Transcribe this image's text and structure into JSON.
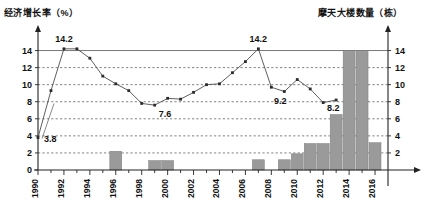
{
  "titles": {
    "left_axis": "经济增长率（%）",
    "right_axis": "摩天大楼数量（栋）"
  },
  "chart_data": {
    "type": "bar",
    "title": "",
    "subtitle": "",
    "xlabel": "",
    "ylabel": "经济增长率（%）",
    "y2label": "摩天大楼数量（栋）",
    "grid": true,
    "legend": "none",
    "ylim": [
      0,
      15
    ],
    "y2lim": [
      0,
      15
    ],
    "yticks": [
      0,
      2,
      4,
      6,
      8,
      10,
      12,
      14
    ],
    "y2ticks": [
      2,
      4,
      6,
      8,
      10,
      12,
      14
    ],
    "xlim": [
      1990,
      2017
    ],
    "xticks": [
      1990,
      1992,
      1994,
      1996,
      1998,
      2000,
      2002,
      2004,
      2006,
      2008,
      2010,
      2012,
      2014,
      2016
    ],
    "xtick_labels": [
      "1990",
      "1992",
      "1994",
      "1996",
      "1998",
      "2000",
      "2002",
      "2004",
      "2006",
      "2008",
      "2010",
      "2012",
      "2014",
      "2016"
    ],
    "x_minor_ticks_every": 1,
    "series": [
      {
        "name": "经济增长率",
        "type": "line",
        "axis": "left",
        "unit": "%",
        "x": [
          1990,
          1991,
          1992,
          1993,
          1994,
          1995,
          1996,
          1997,
          1998,
          1999,
          2000,
          2001,
          2002,
          2003,
          2004,
          2005,
          2006,
          2007,
          2008,
          2009,
          2010,
          2011,
          2012,
          2013
        ],
        "values": [
          3.8,
          9.3,
          14.2,
          14.2,
          13.1,
          11.0,
          10.1,
          9.3,
          7.8,
          7.6,
          8.4,
          8.3,
          9.1,
          10.0,
          10.1,
          11.4,
          12.7,
          14.2,
          9.7,
          9.2,
          10.6,
          9.5,
          7.9,
          8.2
        ]
      },
      {
        "name": "摩天大楼数量",
        "type": "bar",
        "axis": "right",
        "unit": "栋",
        "x": [
          1990,
          1991,
          1992,
          1993,
          1994,
          1995,
          1996,
          1997,
          1998,
          1999,
          2000,
          2001,
          2002,
          2003,
          2004,
          2005,
          2006,
          2007,
          2008,
          2009,
          2010,
          2011,
          2012,
          2013,
          2014,
          2015,
          2016
        ],
        "values": [
          0,
          0,
          0,
          0,
          0,
          0,
          2.2,
          0,
          0,
          1.1,
          1.1,
          0,
          0,
          0,
          0,
          0,
          0,
          1.2,
          0,
          1.2,
          1.9,
          3.1,
          3.1,
          6.5,
          13.9,
          13.9,
          3.2
        ]
      }
    ],
    "annotations": [
      {
        "text": "3.8",
        "x": 1990,
        "y": 3.8,
        "series": "经济增长率"
      },
      {
        "text": "14.2",
        "x": 1992,
        "y": 14.2,
        "series": "经济增长率"
      },
      {
        "text": "7.6",
        "x": 1999,
        "y": 7.6,
        "series": "经济增长率"
      },
      {
        "text": "14.2",
        "x": 2007,
        "y": 14.2,
        "series": "经济增长率"
      },
      {
        "text": "9.2",
        "x": 2009,
        "y": 9.2,
        "series": "经济增长率"
      },
      {
        "text": "8.2",
        "x": 2013,
        "y": 8.2,
        "series": "经济增长率"
      }
    ]
  }
}
